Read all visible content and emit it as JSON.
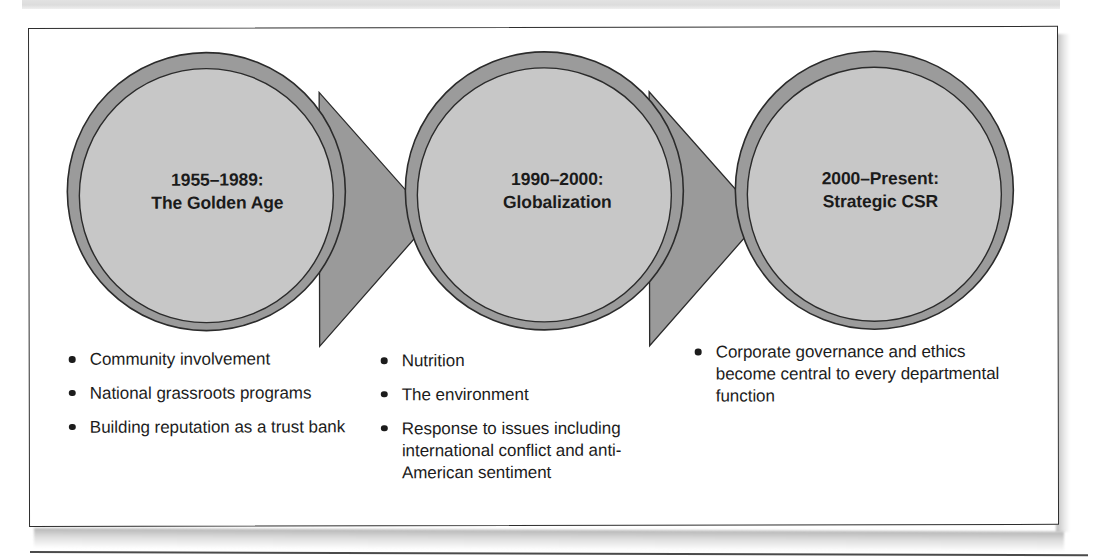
{
  "figure": {
    "type": "process-flow-diagram",
    "orientation": "left-to-right",
    "stage_count": 3
  },
  "colors": {
    "circle_ring": "#9b9b9b",
    "circle_fill": "#c7c7c7",
    "circle_outline": "#2b2b2b",
    "arrow_fill": "#9a9a9a",
    "arrow_outline": "#2b2b2b",
    "frame_border": "#2e2e2e",
    "text": "#1b1b1b",
    "page_background": "#ffffff"
  },
  "stages": [
    {
      "id": "golden-age",
      "title_line1": "1955–1989:",
      "title_line2": "The Golden Age",
      "bullets": [
        "Community involvement",
        "National grassroots programs",
        "Building reputation as a trust bank"
      ]
    },
    {
      "id": "globalization",
      "title_line1": "1990–2000:",
      "title_line2": "Globalization",
      "bullets": [
        "Nutrition",
        "The environment",
        "Response to issues including international conflict and anti-American sentiment"
      ]
    },
    {
      "id": "strategic-csr",
      "title_line1": "2000–Present:",
      "title_line2": "Strategic CSR",
      "bullets": [
        "Corporate governance and ethics become central to every departmental function"
      ]
    }
  ]
}
